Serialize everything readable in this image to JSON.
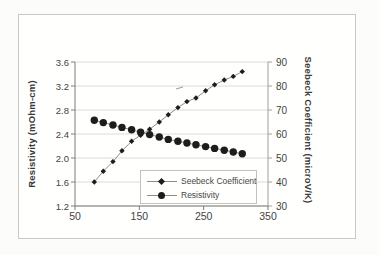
{
  "chart_data": {
    "type": "line",
    "title": "",
    "x": [
      80,
      94,
      109,
      123,
      138,
      152,
      166,
      181,
      195,
      210,
      224,
      238,
      253,
      267,
      282,
      296,
      310
    ],
    "series": [
      {
        "name": "Seebeck Coefficient",
        "axis": "right",
        "marker": "diamond",
        "values": [
          40,
          44.5,
          48.5,
          53,
          57,
          59.5,
          62,
          65,
          68,
          71,
          73.5,
          75,
          78,
          80.5,
          82.5,
          84,
          86
        ]
      },
      {
        "name": "Resistivity",
        "axis": "left",
        "marker": "circle",
        "values": [
          2.63,
          2.59,
          2.55,
          2.51,
          2.47,
          2.43,
          2.39,
          2.35,
          2.31,
          2.28,
          2.25,
          2.22,
          2.19,
          2.16,
          2.13,
          2.1,
          2.07
        ]
      }
    ],
    "x_axis": {
      "ticks": [
        "50",
        "150",
        "250",
        "350"
      ],
      "range": [
        50,
        350
      ]
    },
    "y_axis_left": {
      "label": "Resistivity (mOhm-cm)",
      "ticks": [
        "1.2",
        "1.6",
        "2.0",
        "2.4",
        "2.8",
        "3.2",
        "3.6"
      ],
      "range": [
        1.2,
        3.6
      ]
    },
    "y_axis_right": {
      "label": "Seebeck Coefficient (microV/K)",
      "ticks": [
        "30",
        "40",
        "50",
        "60",
        "70",
        "80",
        "90"
      ],
      "range": [
        30,
        90
      ]
    },
    "grid": true,
    "legend_position": "inside-bottom-center",
    "colors": {
      "marker": "#1d1d1d",
      "line": "#8d8d8d",
      "grid": "#dbdbd4",
      "axis": "#7c7c7c",
      "text": "#434343"
    }
  }
}
